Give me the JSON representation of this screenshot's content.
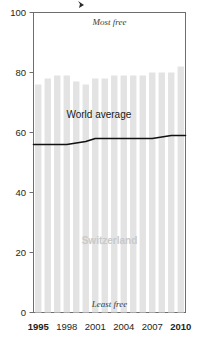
{
  "chart_data": {
    "type": "bar",
    "title": "",
    "subtitle": "",
    "xlabel": "",
    "ylabel": "",
    "ylim": [
      0,
      100
    ],
    "yticks": [
      0,
      20,
      40,
      60,
      80,
      100
    ],
    "ytick_labels": [
      "0",
      "20",
      "40",
      "60",
      "80",
      "100"
    ],
    "grid": false,
    "legend_position": "inline-annotation",
    "categories": [
      1995,
      1996,
      1997,
      1998,
      1999,
      2000,
      2001,
      2002,
      2003,
      2004,
      2005,
      2006,
      2007,
      2008,
      2009,
      2010
    ],
    "xtick_labels": [
      "1995",
      "1998",
      "2001",
      "2004",
      "2007",
      "2010"
    ],
    "xticks": [
      1995,
      1998,
      2001,
      2004,
      2007,
      2010
    ],
    "series": [
      {
        "name": "Switzerland",
        "type": "bar",
        "color": "#e3e3e3",
        "values": [
          76,
          78,
          79,
          79,
          77,
          76,
          78,
          78,
          79,
          79,
          79,
          79,
          80,
          80,
          80,
          82
        ]
      },
      {
        "name": "World average",
        "type": "line",
        "color": "#111111",
        "values": [
          56,
          56,
          56,
          56,
          56.5,
          57,
          58,
          58,
          58,
          58,
          58,
          58,
          58,
          58.5,
          59,
          59
        ]
      }
    ],
    "annotations": [
      {
        "name": "most-free",
        "text": "Most free",
        "x_frac": 0.5,
        "value": 97,
        "style": "italic"
      },
      {
        "name": "least-free",
        "text": "Least free",
        "x_frac": 0.5,
        "value": 3,
        "style": "italic"
      },
      {
        "name": "switzerland-label",
        "text": "Switzerland",
        "x_frac": 0.5,
        "value": 24,
        "style": "bold-gray"
      },
      {
        "name": "world-average-label",
        "text": "World average",
        "x_frac": 0.43,
        "value": 66,
        "style": "plain"
      }
    ]
  },
  "axis": {
    "y_tick_100": "100",
    "y_tick_80": "80",
    "y_tick_60": "60",
    "y_tick_40": "40",
    "y_tick_20": "20",
    "y_tick_0": "0",
    "x_tick_1995": "1995",
    "x_tick_1998": "1998",
    "x_tick_2001": "2001",
    "x_tick_2004": "2004",
    "x_tick_2007": "2007",
    "x_tick_2010": "2010"
  },
  "labels": {
    "most_free": "Most free",
    "least_free": "Least free",
    "switzerland": "Switzerland",
    "world_average": "World average"
  }
}
